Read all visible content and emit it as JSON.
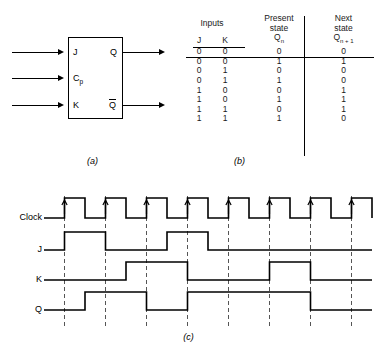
{
  "figure": {
    "captions": {
      "a": "(a)",
      "b": "(b)",
      "c": "(c)"
    }
  },
  "symbol": {
    "inputs": [
      {
        "name": "J",
        "label": "J",
        "sub": ""
      },
      {
        "name": "Cp",
        "label": "C",
        "sub": "p"
      },
      {
        "name": "K",
        "label": "K",
        "sub": ""
      }
    ],
    "outputs": [
      {
        "name": "Q",
        "label": "Q",
        "overbar": false
      },
      {
        "name": "Q-not",
        "label": "Q",
        "overbar": true
      }
    ]
  },
  "table": {
    "headers": {
      "inputs": "Inputs",
      "j": "J",
      "k": "K",
      "present_state": "Present\nstate",
      "present_state_line1": "Present",
      "present_state_line2": "state",
      "present_state_symbol": "Q",
      "present_state_sub": "n",
      "next_state_line1": "Next",
      "next_state_line2": "state",
      "next_state_symbol": "Q",
      "next_state_sub": "n + 1"
    },
    "rows": [
      {
        "j": "0",
        "k": "0",
        "qn": "0",
        "qn1": "0"
      },
      {
        "j": "0",
        "k": "0",
        "qn": "1",
        "qn1": "1"
      },
      {
        "j": "0",
        "k": "1",
        "qn": "0",
        "qn1": "0"
      },
      {
        "j": "0",
        "k": "1",
        "qn": "1",
        "qn1": "0"
      },
      {
        "j": "1",
        "k": "0",
        "qn": "0",
        "qn1": "1"
      },
      {
        "j": "1",
        "k": "0",
        "qn": "1",
        "qn1": "1"
      },
      {
        "j": "1",
        "k": "1",
        "qn": "0",
        "qn1": "1"
      },
      {
        "j": "1",
        "k": "1",
        "qn": "1",
        "qn1": "0"
      }
    ]
  },
  "timing": {
    "labels": {
      "clock": "Clock",
      "j": "J",
      "k": "K",
      "q": "Q"
    },
    "clock_pulses": 8,
    "edge_trigger": "rising",
    "waveforms": {
      "clock": [
        0,
        1,
        0,
        1,
        0,
        1,
        0,
        1,
        0,
        1,
        0,
        1,
        0,
        1,
        0,
        1,
        0
      ],
      "j": [
        0,
        1,
        1,
        0,
        0,
        0,
        1,
        1,
        0,
        0,
        0,
        0,
        0,
        0,
        0,
        0,
        0
      ],
      "k": [
        0,
        0,
        0,
        0,
        1,
        1,
        1,
        0,
        0,
        0,
        0,
        1,
        1,
        0,
        0,
        0,
        0
      ],
      "q": [
        0,
        0,
        1,
        1,
        1,
        0,
        0,
        1,
        1,
        1,
        1,
        1,
        1,
        0,
        0,
        0,
        0
      ]
    }
  },
  "colors": {
    "line": "#000000",
    "background": "#ffffff",
    "dashed": "#555555"
  }
}
